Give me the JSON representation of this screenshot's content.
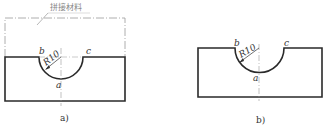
{
  "figure_a": {
    "caption": "a)",
    "material_label": "拼接材料",
    "radius_label": "R10",
    "point_a": "a",
    "point_b": "b",
    "point_c": "c"
  },
  "figure_b": {
    "caption": "b)",
    "radius_label": "R10",
    "point_a": "a",
    "point_b": "b",
    "point_c": "c"
  },
  "colors": {
    "outline": "#2a2a2a",
    "thin_line": "#888888",
    "background": "#ffffff"
  }
}
